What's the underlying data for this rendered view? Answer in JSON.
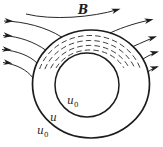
{
  "figure": {
    "field_label": "B",
    "region_labels": {
      "inner_cavity": {
        "base": "u",
        "sub": "0"
      },
      "ring_material": {
        "base": "u"
      },
      "outside": {
        "base": "u",
        "sub": "0"
      }
    },
    "colors": {
      "ink": "#1c1c1c",
      "background": "#ffffff"
    },
    "field_lines": {
      "direction": "left-to-right",
      "left_arrow_count": 4,
      "right_arrow_count": 4,
      "dashed_arcs_in_ring": 4
    }
  }
}
